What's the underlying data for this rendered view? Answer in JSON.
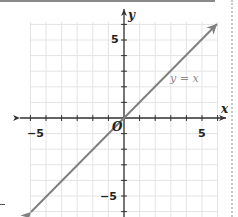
{
  "chart_data": {
    "type": "line",
    "title": "",
    "xlabel": "x",
    "ylabel": "y",
    "xlim": [
      -6,
      6
    ],
    "ylim": [
      -6,
      6
    ],
    "grid": true,
    "x_tick_labels": [
      "-5",
      "5"
    ],
    "y_tick_labels": [
      "5",
      "-5"
    ],
    "origin_label": "O",
    "series": [
      {
        "name": "y = x",
        "x": [
          -6,
          -5,
          0,
          5,
          6
        ],
        "y": [
          -6,
          -5,
          0,
          5,
          6
        ],
        "color": "#808080",
        "arrows": "both"
      }
    ],
    "annotations": [
      {
        "text": "y = x",
        "x": 4.7,
        "y": 2.5
      }
    ]
  },
  "labels": {
    "x_axis": "x",
    "y_axis": "y",
    "x_neg5": "−5",
    "x_pos5": "5",
    "y_pos5": "5",
    "y_neg5": "−5",
    "origin": "O",
    "equation": "y = x"
  },
  "colors": {
    "grid": "#e4e4e4",
    "axis": "#333333",
    "line": "#808080",
    "equation": "#8a8a8a"
  }
}
